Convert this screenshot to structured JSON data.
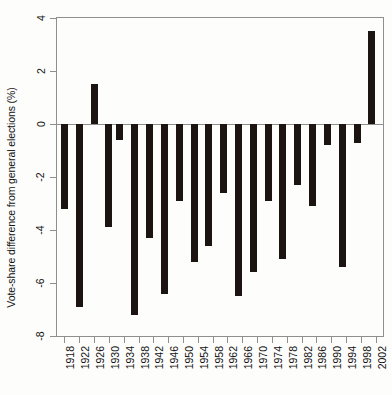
{
  "chart_data": {
    "type": "bar",
    "title": "",
    "subtitle": "",
    "xlabel": "",
    "ylabel": "Vote-share difference from general elections (%)",
    "grid": false,
    "legend": null,
    "ylim": [
      -8,
      4
    ],
    "yticks": [
      4,
      2,
      0,
      -2,
      -4,
      -6,
      -8
    ],
    "ytick_labels": [
      "4",
      "2",
      "0",
      "-2",
      "-4",
      "-6",
      "-8"
    ],
    "xlim": [
      1916,
      2004
    ],
    "xticks": [
      1918,
      1922,
      1926,
      1930,
      1934,
      1938,
      1942,
      1946,
      1950,
      1954,
      1958,
      1962,
      1966,
      1970,
      1974,
      1978,
      1982,
      1986,
      1990,
      1994,
      1998,
      2002
    ],
    "xtick_labels": [
      "1918",
      "1922",
      "1926",
      "1930",
      "1934",
      "1938",
      "1942",
      "1946",
      "1950",
      "1954",
      "1958",
      "1962",
      "1966",
      "1970",
      "1974",
      "1978",
      "1982",
      "1986",
      "1990",
      "1994",
      "1998",
      "2002"
    ],
    "categories": [
      1918,
      1922,
      1924,
      1929,
      1931,
      1935,
      1945,
      1950,
      1951,
      1955,
      1959,
      1964,
      1966,
      1970,
      1974,
      1979,
      1983,
      1987,
      1992,
      1997,
      2001
    ],
    "values": [
      -3.2,
      -6.9,
      1.5,
      -3.9,
      -0.6,
      -7.2,
      -4.3,
      -6.4,
      -2.9,
      -5.2,
      -4.6,
      -2.6,
      -6.5,
      -5.6,
      -2.9,
      -5.1,
      -2.3,
      -0.8,
      -5.4,
      -0.7,
      3.5
    ],
    "bar_color": "#1b1410",
    "baseline": 0,
    "axis_color": "#8f8f8f",
    "bars": [
      {
        "x": 1918,
        "value": -3.2,
        "label": "1918"
      },
      {
        "x": 1922,
        "value": -6.9,
        "label": "1922"
      },
      {
        "x": 1926,
        "value": 1.5,
        "label": "1926"
      },
      {
        "x": 1930,
        "value": -3.9,
        "label": "1930"
      },
      {
        "x": 1933,
        "value": -0.6,
        "label": "1933"
      },
      {
        "x": 1937,
        "value": -7.2,
        "label": "1937"
      },
      {
        "x": 1941,
        "value": -4.3,
        "label": "1941"
      },
      {
        "x": 1945,
        "value": -6.4,
        "label": "1945"
      },
      {
        "x": 1949,
        "value": -2.9,
        "label": "1949"
      },
      {
        "x": 1953,
        "value": -5.2,
        "label": "1953"
      },
      {
        "x": 1957,
        "value": -4.6,
        "label": "1957"
      },
      {
        "x": 1961,
        "value": -2.6,
        "label": "1961"
      },
      {
        "x": 1965,
        "value": -6.5,
        "label": "1965"
      },
      {
        "x": 1969,
        "value": -5.6,
        "label": "1969"
      },
      {
        "x": 1973,
        "value": -2.9,
        "label": "1973"
      },
      {
        "x": 1977,
        "value": -5.1,
        "label": "1977"
      },
      {
        "x": 1981,
        "value": -2.3,
        "label": "1981"
      },
      {
        "x": 1985,
        "value": -3.1,
        "label": "1985"
      },
      {
        "x": 1989,
        "value": -0.8,
        "label": "1989"
      },
      {
        "x": 1993,
        "value": -5.4,
        "label": "1993"
      },
      {
        "x": 1997,
        "value": -0.7,
        "label": "1997"
      },
      {
        "x": 2001,
        "value": 3.5,
        "label": "2001"
      }
    ]
  }
}
